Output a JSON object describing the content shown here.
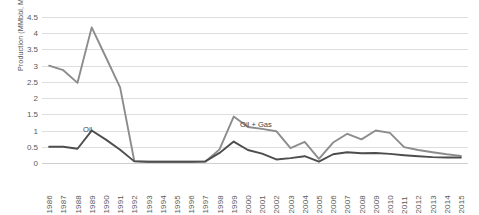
{
  "chart_data": {
    "type": "line",
    "title": "",
    "xlabel": "",
    "ylabel": "Production (MMbbl, MMboe)",
    "ylim": [
      0,
      4.5
    ],
    "ytick_labels": [
      "0",
      "0.5",
      "1",
      "1.5",
      "2",
      "2.5",
      "3",
      "3.5",
      "4",
      "4.5"
    ],
    "ytick_values": [
      0,
      0.5,
      1,
      1.5,
      2,
      2.5,
      3,
      3.5,
      4,
      4.5
    ],
    "grid": true,
    "legend_position": "inline-annotation",
    "categories": [
      "1986",
      "1987",
      "1988",
      "1989",
      "1990",
      "1991",
      "1992",
      "1993",
      "1994",
      "1995",
      "1996",
      "1997",
      "1998",
      "1999",
      "2000",
      "2001",
      "2002",
      "2003",
      "2004",
      "2005",
      "2006",
      "2007",
      "2008",
      "2009",
      "2010",
      "2011",
      "2012",
      "2013",
      "2014",
      "2015"
    ],
    "series": [
      {
        "name": "Oil + Gas",
        "color": "#8c8c8c",
        "values": [
          3.0,
          2.86,
          2.47,
          4.18,
          3.26,
          2.33,
          0.06,
          0.04,
          0.04,
          0.04,
          0.04,
          0.04,
          0.42,
          1.43,
          1.11,
          1.05,
          0.98,
          0.46,
          0.65,
          0.13,
          0.63,
          0.9,
          0.73,
          1.0,
          0.93,
          0.49,
          0.4,
          0.33,
          0.27,
          0.22
        ]
      },
      {
        "name": "Oil",
        "color": "#4d4d4d",
        "values": [
          0.5,
          0.5,
          0.44,
          1.0,
          0.72,
          0.41,
          0.05,
          0.04,
          0.04,
          0.04,
          0.04,
          0.05,
          0.31,
          0.66,
          0.4,
          0.29,
          0.11,
          0.15,
          0.21,
          0.04,
          0.27,
          0.33,
          0.3,
          0.31,
          0.28,
          0.24,
          0.21,
          0.18,
          0.17,
          0.17
        ]
      }
    ],
    "annotations": [
      {
        "text": "Oil",
        "series": "Oil",
        "near_year": "1989"
      },
      {
        "text": "Oil + Gas",
        "series": "Oil + Gas",
        "near_year": "1999"
      }
    ]
  }
}
